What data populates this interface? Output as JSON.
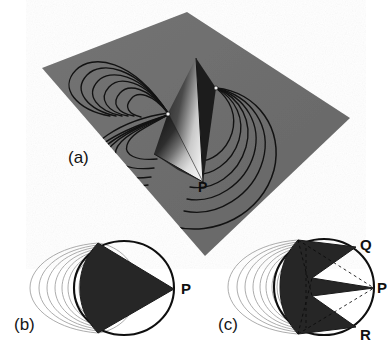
{
  "figure": {
    "background_color": "#ffffff",
    "panel_count": 3
  },
  "panels": [
    {
      "id": "a",
      "label": "(a)",
      "view": "three-dimensional perspective",
      "description": "Tilted gray plane with shaded cone and closed field-line loops",
      "plane_color": "#707070",
      "plane_shadow_color": "#5c5c5c",
      "cone_dark_color": "#1d1d1d",
      "cone_light_color": "#e8e8e8",
      "fieldline_color": "#111111",
      "points": [
        {
          "name": "P",
          "label": "P",
          "role": "cone-apex"
        }
      ]
    },
    {
      "id": "b",
      "label": "(b)",
      "view": "front elevation",
      "description": "Single cone silhouette inside ellipse with nested field lines",
      "cone_color": "#262626",
      "ellipse_color": "#0f0f0f",
      "fieldline_color": "#9a9a9a",
      "points": [
        {
          "name": "P",
          "label": "P",
          "role": "cone-apex"
        }
      ]
    },
    {
      "id": "c",
      "label": "(c)",
      "view": "front elevation",
      "description": "Three-lobed cone silhouette inside ellipse with dashed construction lines and nested field lines",
      "cone_color": "#262626",
      "ellipse_color": "#0f0f0f",
      "fieldline_color": "#9a9a9a",
      "dashed_line_color": "#080808",
      "points": [
        {
          "name": "Q",
          "label": "Q",
          "role": "upper-apex"
        },
        {
          "name": "P",
          "label": "P",
          "role": "middle-apex"
        },
        {
          "name": "R",
          "label": "R",
          "role": "lower-apex"
        }
      ]
    }
  ]
}
